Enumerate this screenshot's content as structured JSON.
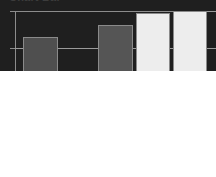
{
  "chart_data": {
    "type": "bar",
    "title": "Chart Bar",
    "xlabel": "",
    "ylabel": "",
    "categories": [
      "1",
      "2",
      "3",
      "4",
      "5"
    ],
    "values": [
      47,
      83,
      22,
      91,
      99
    ],
    "ylim": [
      0,
      100
    ],
    "grid": true,
    "gridlines": [
      0,
      25,
      50,
      75,
      100
    ],
    "legend": "none",
    "tick_labels": [],
    "series": [
      {
        "name": "Series 1",
        "values": [
          47,
          83,
          22,
          91,
          99
        ],
        "colors": [
          "#1f1f1f",
          "#4f4f4f",
          "#bcbcbc",
          "#555555",
          "#ededed"
        ]
      }
    ],
    "bar_border_color": "#8a8a8a",
    "axis_color": "#8c8c8c",
    "grid_color": "#9a9a9a",
    "title_color": "#3c3c3c"
  },
  "bars": [
    {
      "label": "1",
      "value": 47,
      "color": "#1f1f1f"
    },
    {
      "label": "2",
      "value": 83,
      "color": "#4f4f4f"
    },
    {
      "label": "3",
      "value": 22,
      "color": "#bcbcbc"
    },
    {
      "label": "4",
      "value": 91,
      "color": "#555555"
    },
    {
      "label": "5",
      "value": 99,
      "color": "#ededed"
    }
  ]
}
